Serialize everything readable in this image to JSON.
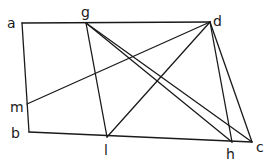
{
  "diagram": {
    "type": "geometric-figure",
    "points": {
      "a": {
        "label": "a",
        "x": 22,
        "y": 23
      },
      "g": {
        "label": "g",
        "x": 86,
        "y": 23
      },
      "d": {
        "label": "d",
        "x": 210,
        "y": 22
      },
      "m": {
        "label": "m",
        "x": 27,
        "y": 104
      },
      "b": {
        "label": "b",
        "x": 29,
        "y": 132
      },
      "l": {
        "label": "l",
        "x": 107,
        "y": 137
      },
      "h": {
        "label": "h",
        "x": 232,
        "y": 142
      },
      "c": {
        "label": "c",
        "x": 252,
        "y": 142
      }
    },
    "segments": [
      [
        "a",
        "d"
      ],
      [
        "a",
        "b"
      ],
      [
        "b",
        "c"
      ],
      [
        "d",
        "c"
      ],
      [
        "g",
        "l"
      ],
      [
        "g",
        "h"
      ],
      [
        "g",
        "c"
      ],
      [
        "d",
        "m"
      ],
      [
        "d",
        "l"
      ],
      [
        "d",
        "h"
      ]
    ],
    "labels": {
      "a": "a",
      "g": "g",
      "d": "d",
      "m": "m",
      "b": "b",
      "l": "l",
      "h": "h",
      "c": "c"
    }
  }
}
